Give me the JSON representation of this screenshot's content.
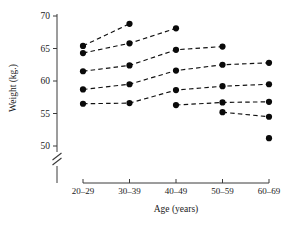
{
  "chart_data": {
    "type": "line",
    "title": "",
    "xlabel": "Age (years)",
    "ylabel": "Weight (kg.)",
    "categories": [
      "20–29",
      "30–39",
      "40–49",
      "50–59",
      "60–69"
    ],
    "x": [
      1,
      2,
      3,
      4,
      5
    ],
    "ylim": [
      48.5,
      70.5
    ],
    "yticks": [
      50,
      55,
      60,
      65,
      70
    ],
    "ytick_labels": [
      "50",
      "55",
      "60",
      "65",
      "70"
    ],
    "xtick_labels": [
      "20–29",
      "30–39",
      "40–49",
      "50–59",
      "60–69"
    ],
    "grid": false,
    "legend": "none",
    "axis_break": true,
    "axis_break_note": "y-axis broken below 50",
    "line_style": "dashed",
    "marker": "filled-circle",
    "marker_color": "#0a0a0a",
    "line_color": "#111111",
    "series": [
      {
        "name": "cohort-1",
        "categories": [
          "20–29",
          "30–39"
        ],
        "x": [
          1,
          2
        ],
        "values": [
          65.4,
          68.8
        ]
      },
      {
        "name": "cohort-2",
        "categories": [
          "20–29",
          "30–39",
          "40–49"
        ],
        "x": [
          1,
          2,
          3
        ],
        "values": [
          64.3,
          65.8,
          68.1
        ]
      },
      {
        "name": "cohort-3",
        "categories": [
          "20–29",
          "30–39",
          "40–49",
          "50–59"
        ],
        "x": [
          1,
          2,
          3,
          4
        ],
        "values": [
          61.5,
          62.4,
          64.8,
          65.3
        ]
      },
      {
        "name": "cohort-4",
        "categories": [
          "20–29",
          "30–39",
          "40–49",
          "50–59",
          "60–69"
        ],
        "x": [
          1,
          2,
          3,
          4,
          5
        ],
        "values": [
          58.7,
          59.5,
          61.6,
          62.5,
          62.8
        ]
      },
      {
        "name": "cohort-5",
        "categories": [
          "20–29",
          "30–39",
          "40–49",
          "50–59",
          "60–69"
        ],
        "x": [
          1,
          2,
          3,
          4,
          5
        ],
        "values": [
          56.5,
          56.6,
          58.6,
          59.2,
          59.5
        ]
      },
      {
        "name": "cohort-6",
        "categories": [
          "40–49",
          "50–59",
          "60–69"
        ],
        "x": [
          3,
          4,
          5
        ],
        "values": [
          56.3,
          56.7,
          56.8
        ]
      },
      {
        "name": "cohort-7",
        "categories": [
          "50–59",
          "60–69"
        ],
        "x": [
          4,
          5
        ],
        "values": [
          55.2,
          54.5
        ]
      },
      {
        "name": "cohort-8",
        "categories": [
          "60–69"
        ],
        "x": [
          5
        ],
        "values": [
          51.2
        ]
      }
    ]
  }
}
